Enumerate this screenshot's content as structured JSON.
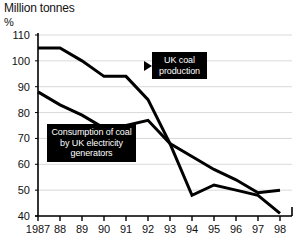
{
  "title": "Million tonnes",
  "subtitle": "%",
  "callouts": {
    "production": "UK coal production",
    "consumption": "Consumption of coal by UK electricity generators"
  },
  "axis": {
    "y_ticks": [
      "110",
      "100",
      "90",
      "80",
      "70",
      "60",
      "50",
      "40"
    ],
    "x_ticks": [
      "1987",
      "88",
      "89",
      "90",
      "91",
      "92",
      "93",
      "94",
      "95",
      "96",
      "97",
      "98"
    ]
  },
  "colors": {
    "line": "#000000",
    "grid": "#d9d9d9",
    "axis": "#000000",
    "callout_bg": "#000000",
    "callout_fg": "#ffffff"
  },
  "chart_data": {
    "type": "line",
    "title": "Million tonnes",
    "subtitle": "%",
    "xlabel": "",
    "ylabel": "Million tonnes %",
    "x": [
      1987,
      1988,
      1989,
      1990,
      1991,
      1992,
      1993,
      1994,
      1995,
      1996,
      1997,
      1998
    ],
    "xtick_labels": [
      "1987",
      "88",
      "89",
      "90",
      "91",
      "92",
      "93",
      "94",
      "95",
      "96",
      "97",
      "98"
    ],
    "ylim": [
      40,
      110
    ],
    "ytick_values": [
      40,
      50,
      60,
      70,
      80,
      90,
      100,
      110
    ],
    "grid": true,
    "legend": "annotations",
    "series": [
      {
        "name": "UK coal production",
        "values": [
          105,
          105,
          100,
          94,
          94,
          85,
          68,
          48,
          52,
          50,
          48,
          41
        ]
      },
      {
        "name": "Consumption of coal by UK electricity generators",
        "values": [
          88,
          83,
          79,
          74,
          75,
          77,
          68,
          63,
          58,
          54,
          49,
          50
        ]
      }
    ],
    "annotations": [
      {
        "text": "UK coal production",
        "points_to": "upper-line"
      },
      {
        "text": "Consumption of coal by UK electricity generators",
        "points_to": "lower-line"
      }
    ]
  }
}
